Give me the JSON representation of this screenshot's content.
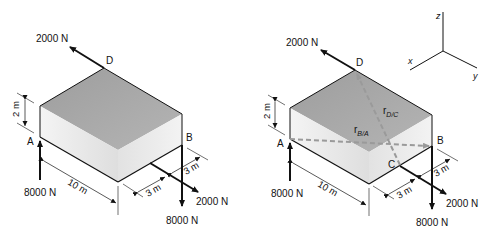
{
  "figures": [
    {
      "id": "left",
      "points": {
        "A": "A",
        "B": "B",
        "D": "D"
      },
      "forces": {
        "top": "2000 N",
        "A": "8000 N",
        "B_down": "8000 N",
        "B_side": "2000 N"
      },
      "dimensions": {
        "height": "2 m",
        "length": "10 m",
        "offset1": "3 m",
        "offset2": "3 m"
      }
    },
    {
      "id": "right",
      "points": {
        "A": "A",
        "B": "B",
        "C": "C",
        "D": "D"
      },
      "forces": {
        "top": "2000 N",
        "A": "8000 N",
        "B_down": "8000 N",
        "C_side": "2000 N"
      },
      "dimensions": {
        "height": "2 m",
        "length": "10 m",
        "offset1": "3 m",
        "offset2": "3 m"
      },
      "vectors": {
        "r_DC": {
          "main": "r",
          "sub": "D/C"
        },
        "r_BA": {
          "main": "r",
          "sub": "B/A"
        }
      },
      "axes": {
        "x": "x",
        "y": "y",
        "z": "z"
      }
    }
  ],
  "colors": {
    "top_face": "#a9a9a9",
    "front_face": "#e4e4e4",
    "side_face": "#ececec",
    "dashed": "#9a9a9a",
    "line": "#111111"
  }
}
